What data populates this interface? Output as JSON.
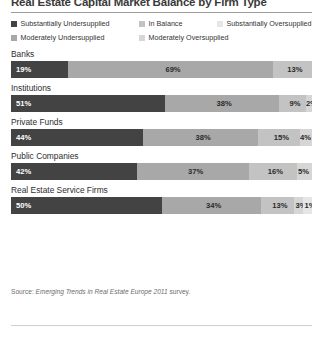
{
  "chart_data": {
    "type": "bar",
    "orientation": "horizontal",
    "stacked": true,
    "units": "percent",
    "title": "Real Estate Capital Market Balance by Firm Type",
    "xlabel": "",
    "ylabel": "",
    "xlim": [
      0,
      100
    ],
    "grid": false,
    "legend_position": "top",
    "series": [
      {
        "name": "Substantially Undersupplied",
        "color": "#434343",
        "values": [
          19,
          51,
          44,
          42,
          50
        ]
      },
      {
        "name": "Moderately Undersupplied",
        "color": "#a8a8a8",
        "values": [
          69,
          38,
          38,
          37,
          34
        ]
      },
      {
        "name": "In Balance",
        "color": "#c3c3c3",
        "values": [
          13,
          9,
          15,
          16,
          13
        ]
      },
      {
        "name": "Moderately Oversupplied",
        "color": "#d6d6d6",
        "values": [
          0,
          2,
          4,
          5,
          3
        ]
      },
      {
        "name": "Substantially Oversupplied",
        "color": "#e6e6e6",
        "values": [
          0,
          0,
          0,
          0,
          1
        ]
      }
    ],
    "categories": [
      "Banks",
      "Institutions",
      "Private Funds",
      "Public Companies",
      "Real Estate Service Firms"
    ],
    "source": "Source: Emerging Trends in Real Estate Europe 2011 survey."
  },
  "legend": {
    "rows": [
      [
        {
          "label": "Substantially Undersupplied",
          "swatch": "sw0"
        },
        {
          "label": "In Balance",
          "swatch": "sw2"
        },
        {
          "label": "Substantially Oversupplied",
          "swatch": "sw4"
        }
      ],
      [
        {
          "label": "Moderately Undersupplied",
          "swatch": "sw1"
        },
        {
          "label": "Moderately Oversupplied",
          "swatch": "sw3"
        }
      ]
    ]
  },
  "groups": [
    {
      "label": "Banks",
      "segments": [
        {
          "value": "19%",
          "pct": 19,
          "tone": "s0",
          "align": "left"
        },
        {
          "value": "69%",
          "pct": 68,
          "tone": "s1",
          "align": "center"
        },
        {
          "value": "13%",
          "pct": 13,
          "tone": "s2",
          "align": "center"
        }
      ]
    },
    {
      "label": "Institutions",
      "segments": [
        {
          "value": "51%",
          "pct": 51,
          "tone": "s0",
          "align": "left"
        },
        {
          "value": "38%",
          "pct": 38,
          "tone": "s1",
          "align": "center"
        },
        {
          "value": "9%",
          "pct": 9,
          "tone": "s2",
          "align": "center"
        },
        {
          "value": "2%",
          "pct": 2,
          "tone": "s3",
          "align": "right"
        }
      ]
    },
    {
      "label": "Private Funds",
      "segments": [
        {
          "value": "44%",
          "pct": 44,
          "tone": "s0",
          "align": "left"
        },
        {
          "value": "38%",
          "pct": 38,
          "tone": "s1",
          "align": "center"
        },
        {
          "value": "15%",
          "pct": 14,
          "tone": "s2",
          "align": "center"
        },
        {
          "value": "4%",
          "pct": 4,
          "tone": "s3",
          "align": "right"
        }
      ]
    },
    {
      "label": "Public Companies",
      "segments": [
        {
          "value": "42%",
          "pct": 42,
          "tone": "s0",
          "align": "left"
        },
        {
          "value": "37%",
          "pct": 37,
          "tone": "s1",
          "align": "center"
        },
        {
          "value": "16%",
          "pct": 16,
          "tone": "s2",
          "align": "center"
        },
        {
          "value": "5%",
          "pct": 5,
          "tone": "s3",
          "align": "right"
        }
      ]
    },
    {
      "label": "Real Estate Service Firms",
      "segments": [
        {
          "value": "50%",
          "pct": 50,
          "tone": "s0",
          "align": "left"
        },
        {
          "value": "34%",
          "pct": 33,
          "tone": "s1",
          "align": "center"
        },
        {
          "value": "13%",
          "pct": 11,
          "tone": "s2",
          "align": "center"
        },
        {
          "value": "3%",
          "pct": 3,
          "tone": "s3",
          "align": "center"
        },
        {
          "value": "1%",
          "pct": 3,
          "tone": "s4",
          "align": "center"
        }
      ]
    }
  ],
  "source": {
    "label": "Source:",
    "title": "Emerging Trends in Real Estate Europe 2011",
    "tail": "survey."
  }
}
